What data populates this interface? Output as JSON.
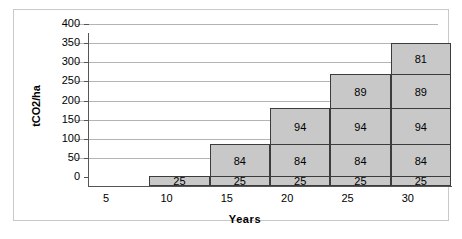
{
  "chart_data": {
    "type": "bar",
    "subtype": "stacked-bar",
    "title": "",
    "xlabel": "Years",
    "ylabel": "tCO2/ha",
    "categories": [
      "5",
      "10",
      "15",
      "20",
      "25",
      "30"
    ],
    "ylim": [
      0,
      400
    ],
    "yticks": [
      0,
      50,
      100,
      150,
      200,
      250,
      300,
      350,
      400
    ],
    "ytick_labels": [
      "0",
      "50",
      "100",
      "150",
      "200",
      "250",
      "300",
      "350",
      "400"
    ],
    "grid": true,
    "legend": "none",
    "series": [
      {
        "name": "Segment 1",
        "values": [
          0,
          25,
          25,
          25,
          25,
          25
        ]
      },
      {
        "name": "Segment 2",
        "values": [
          0,
          0,
          84,
          84,
          84,
          84
        ]
      },
      {
        "name": "Segment 3",
        "values": [
          0,
          0,
          0,
          94,
          94,
          94
        ]
      },
      {
        "name": "Segment 4",
        "values": [
          0,
          0,
          0,
          0,
          89,
          89
        ]
      },
      {
        "name": "Segment 5",
        "values": [
          0,
          0,
          0,
          0,
          0,
          81
        ]
      }
    ],
    "totals": [
      0,
      25,
      109,
      203,
      292,
      373
    ],
    "bar_labels": [
      [],
      [
        "25"
      ],
      [
        "25",
        "84"
      ],
      [
        "25",
        "84",
        "94"
      ],
      [
        "25",
        "84",
        "94",
        "89"
      ],
      [
        "25",
        "84",
        "94",
        "89",
        "81"
      ]
    ],
    "colors": {
      "bar_fill": "#c8c8c8",
      "bar_border": "#3c3c3c",
      "gridline": "#b4b4b4",
      "axis": "#555555",
      "frame": "#c9c9c9",
      "background": "#ffffff",
      "text": "#000000"
    }
  }
}
